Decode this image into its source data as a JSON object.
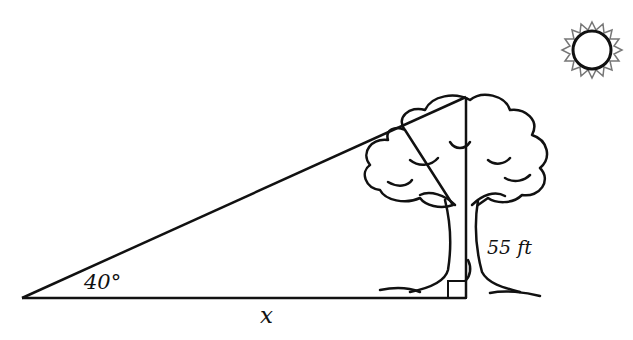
{
  "diagram": {
    "angle_label": "40°",
    "base_label": "x",
    "height_label": "55 ft",
    "shapes": {
      "triangle": {
        "type": "right-triangle",
        "angle_deg": 40,
        "height_ft": 55,
        "base": "x"
      },
      "tree": "tree",
      "sun": "sun"
    },
    "colors": {
      "stroke": "#111111",
      "background": "#ffffff"
    }
  }
}
